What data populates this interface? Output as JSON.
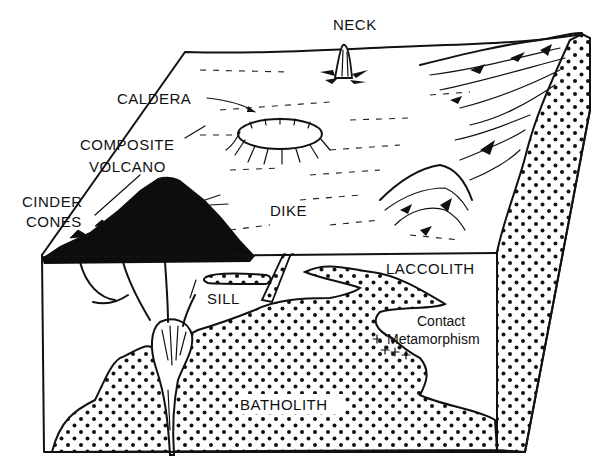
{
  "diagram": {
    "type": "block-diagram",
    "labels": {
      "neck": "NECK",
      "caldera": "CALDERA",
      "composite_volcano_line1": "COMPOSITE",
      "composite_volcano_line2": "VOLCANO",
      "cinder_cones_line1": "CINDER",
      "cinder_cones_line2": "CONES",
      "dike": "DIKE",
      "laccolith": "LACCOLITH",
      "sill": "SILL",
      "contact_metamorphism_line1": "Contact",
      "contact_metamorphism_line2": "Metamorphism",
      "batholith": "BATHOLITH"
    },
    "colors": {
      "ink": "#111111",
      "background": "#ffffff"
    }
  }
}
